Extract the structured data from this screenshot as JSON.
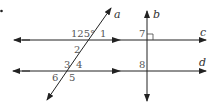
{
  "figure": {
    "bullet": "•",
    "lines": {
      "a": {
        "label": "a",
        "type": "transversal"
      },
      "b": {
        "label": "b",
        "type": "perpendicular"
      },
      "c": {
        "label": "c",
        "type": "parallel"
      },
      "d": {
        "label": "d",
        "type": "parallel"
      }
    },
    "angles": {
      "given": "125°",
      "a1": "1",
      "a2": "2",
      "a3": "3",
      "a4": "4",
      "a5": "5",
      "a6": "6",
      "a7": "7",
      "a8": "8"
    },
    "colors": {
      "line": "#222222",
      "label": "#555555"
    }
  }
}
